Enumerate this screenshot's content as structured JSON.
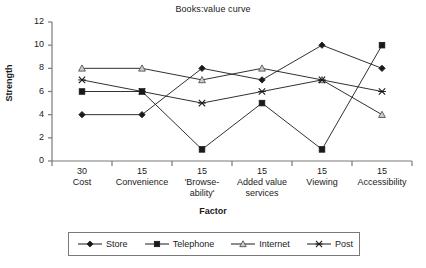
{
  "chart_data": {
    "type": "line",
    "title": "Books:value curve",
    "xlabel": "Factor",
    "ylabel": "Strength",
    "ylim": [
      0,
      12
    ],
    "ytick_step": 2,
    "yticks": [
      "0",
      "2",
      "4",
      "6",
      "8",
      "10",
      "12"
    ],
    "grid": false,
    "legend_position": "bottom",
    "categories": [
      {
        "weight": "30",
        "name": "Cost"
      },
      {
        "weight": "15",
        "name": "Convenience"
      },
      {
        "weight": "15",
        "name": "'Browse-\nability'"
      },
      {
        "weight": "15",
        "name": "Added value\nservices"
      },
      {
        "weight": "15",
        "name": "Viewing"
      },
      {
        "weight": "15",
        "name": "Accessibility"
      }
    ],
    "series": [
      {
        "name": "Store",
        "marker": "diamond",
        "values": [
          4,
          4,
          8,
          7,
          10,
          8
        ]
      },
      {
        "name": "Telephone",
        "marker": "square",
        "values": [
          6,
          6,
          1,
          5,
          1,
          10
        ]
      },
      {
        "name": "Internet",
        "marker": "triangle",
        "values": [
          8,
          8,
          7,
          8,
          7,
          4
        ]
      },
      {
        "name": "Post",
        "marker": "cross",
        "values": [
          7,
          6,
          5,
          6,
          7,
          6
        ]
      }
    ],
    "colors": {
      "line": "#1a1a1a",
      "axis": "#7a7a7a",
      "marker_fill": "#1a1a1a",
      "marker_open": "#cccccc",
      "background": "#ffffff"
    }
  }
}
